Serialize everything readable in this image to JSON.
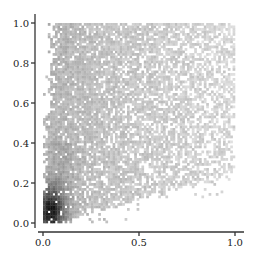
{
  "chart_data": {
    "type": "heatmap",
    "title": "",
    "xlabel": "",
    "ylabel": "",
    "xlim": [
      0.0,
      1.0
    ],
    "ylim": [
      0.0,
      1.0
    ],
    "x_ticks": [
      "0.0",
      "0.5",
      "1.0"
    ],
    "y_ticks": [
      "0.0",
      "0.2",
      "0.4",
      "0.6",
      "0.8",
      "1.0"
    ],
    "grid": false,
    "legend": null,
    "colormap": "grayscale (white = low density, black = high density)",
    "density_peak": {
      "x": 0.05,
      "y": 0.05
    },
    "bins": 80,
    "colors": {
      "low": "#e8e8e8",
      "mid": "#b4b4b4",
      "high": "#1a1a1a"
    }
  },
  "axes": {
    "x_tick_labels": [
      "0.0",
      "0.5",
      "1.0"
    ],
    "y_tick_labels": [
      "0.0",
      "0.2",
      "0.4",
      "0.6",
      "0.8",
      "1.0"
    ]
  }
}
